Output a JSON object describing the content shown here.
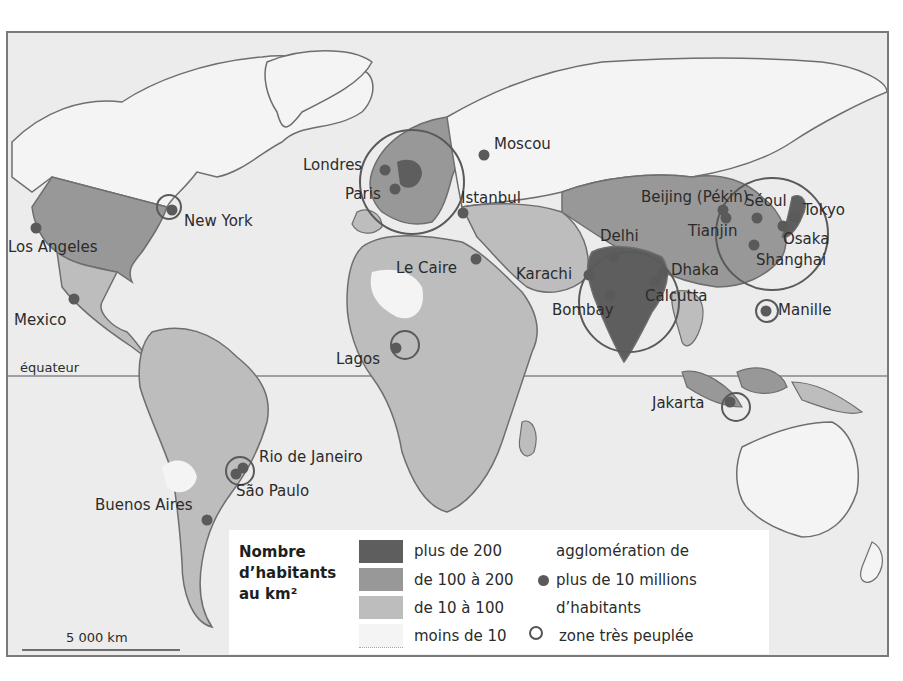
{
  "map": {
    "title": "",
    "equator_label": "équateur",
    "scale_label": "5 000 km",
    "colors": {
      "ocean": "#ececec",
      "density_over_200": "#5e5e5e",
      "density_100_200": "#989898",
      "density_10_100": "#bdbdbd",
      "density_under_10": "#f4f4f4",
      "city_dot": "#5a5a5a",
      "outline": "#6e6e6e"
    },
    "cities": [
      {
        "name": "Los Angeles",
        "x": 34,
        "y": 226
      },
      {
        "name": "Mexico",
        "x": 72,
        "y": 297
      },
      {
        "name": "New York",
        "x": 170,
        "y": 208
      },
      {
        "name": "Londres",
        "x": 383,
        "y": 168
      },
      {
        "name": "Paris",
        "x": 393,
        "y": 187
      },
      {
        "name": "Moscou",
        "x": 482,
        "y": 153
      },
      {
        "name": "Istanbul",
        "x": 461,
        "y": 211
      },
      {
        "name": "Le Caire",
        "x": 474,
        "y": 257
      },
      {
        "name": "Lagos",
        "x": 394,
        "y": 346
      },
      {
        "name": "Karachi",
        "x": 587,
        "y": 273
      },
      {
        "name": "Delhi",
        "x": 612,
        "y": 255
      },
      {
        "name": "Bombay",
        "x": 608,
        "y": 293
      },
      {
        "name": "Calcutta",
        "x": 653,
        "y": 279
      },
      {
        "name": "Dhaka",
        "x": 661,
        "y": 271
      },
      {
        "name": "Beijing (Pékin)",
        "x": 721,
        "y": 208
      },
      {
        "name": "Tianjin",
        "x": 724,
        "y": 216
      },
      {
        "name": "Séoul",
        "x": 755,
        "y": 216
      },
      {
        "name": "Tokyo",
        "x": 793,
        "y": 215
      },
      {
        "name": "Osaka",
        "x": 781,
        "y": 224
      },
      {
        "name": "Shanghai",
        "x": 752,
        "y": 243
      },
      {
        "name": "Manille",
        "x": 764,
        "y": 309
      },
      {
        "name": "Jakarta",
        "x": 728,
        "y": 400
      },
      {
        "name": "Rio de Janeiro",
        "x": 241,
        "y": 466
      },
      {
        "name": "São Paulo",
        "x": 234,
        "y": 472
      },
      {
        "name": "Buenos Aires",
        "x": 205,
        "y": 518
      }
    ],
    "zones_tres_peuplees": [
      {
        "x": 167,
        "y": 205,
        "r": 12
      },
      {
        "x": 410,
        "y": 180,
        "r": 52
      },
      {
        "x": 403,
        "y": 343,
        "r": 14
      },
      {
        "x": 627,
        "y": 300,
        "r": 50
      },
      {
        "x": 770,
        "y": 232,
        "r": 56
      },
      {
        "x": 765,
        "y": 309,
        "r": 11
      },
      {
        "x": 734,
        "y": 405,
        "r": 14
      },
      {
        "x": 238,
        "y": 469,
        "r": 14
      }
    ]
  },
  "legend": {
    "title_line1": "Nombre",
    "title_line2": "d’habitants",
    "title_line3": "au km²",
    "density_classes": [
      {
        "label": "plus de 200",
        "color": "#5e5e5e"
      },
      {
        "label": "de 100 à 200",
        "color": "#989898"
      },
      {
        "label": "de 10 à 100",
        "color": "#bdbdbd"
      },
      {
        "label": "moins de 10",
        "color": "#f4f4f4"
      }
    ],
    "agglomeration_line1": "agglomération de",
    "agglomeration_line2": "plus de 10 millions",
    "agglomeration_line3": "d’habitants",
    "zone_label": "zone très peuplée"
  }
}
